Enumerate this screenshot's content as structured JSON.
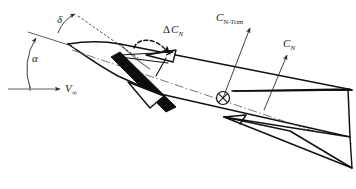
{
  "figure": {
    "background_color": "#ffffff",
    "line_color": "#111111",
    "width": 356,
    "height": 189
  },
  "labels": {
    "angle_of_attack": {
      "symbol": "α",
      "name": "angle-of-attack",
      "x": 32,
      "y": 62
    },
    "control_deflection": {
      "symbol": "δ",
      "name": "canard-deflection-angle",
      "x": 57,
      "y": 23
    },
    "freestream_velocity": {
      "symbol": "V",
      "subscript": "∞",
      "name": "freestream-velocity",
      "x": 65,
      "y": 92
    },
    "delta_cn": {
      "prefix": "Δ",
      "symbol": "C",
      "subscript": "N",
      "name": "incremental-normal-force-coefficient",
      "x": 163,
      "y": 33
    },
    "cn_trim": {
      "symbol": "C",
      "subscript": "N-Trim",
      "name": "trim-normal-force-coefficient",
      "x": 216,
      "y": 21
    },
    "cn": {
      "symbol": "C",
      "subscript": "N",
      "name": "normal-force-coefficient",
      "x": 283,
      "y": 47
    }
  },
  "markers": {
    "center_of_gravity": {
      "name": "center-of-gravity-marker",
      "x": 223,
      "y": 98,
      "radius": 6.5
    }
  },
  "geometry": {
    "body_axis_angle_deg": -22,
    "velocity_axis_angle_deg": 0,
    "notes": "Missile body inclined nose-up-left; freestream horizontal"
  }
}
